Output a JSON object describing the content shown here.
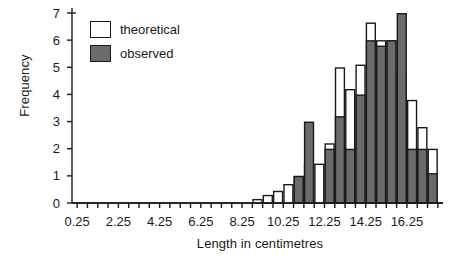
{
  "chart_data": {
    "type": "bar",
    "title": "",
    "subtitle": "",
    "xlabel": "Length in centimetres",
    "ylabel": "Frequency",
    "xlim": [
      0.0,
      18.0
    ],
    "ylim": [
      0,
      7
    ],
    "bin_width": 0.5,
    "grid": false,
    "legend_position": "top-left",
    "x_tick_labels": [
      "0.25",
      "2.25",
      "4.25",
      "6.25",
      "8.25",
      "10.25",
      "12.25",
      "14.25",
      "16.25"
    ],
    "x_tick_values": [
      0.25,
      2.25,
      4.25,
      6.25,
      8.25,
      10.25,
      12.25,
      14.25,
      16.25
    ],
    "x_minor_tick_step": 0.5,
    "y_tick_labels": [
      "0",
      "1",
      "2",
      "3",
      "4",
      "5",
      "6",
      "7"
    ],
    "y_tick_values": [
      0,
      1,
      2,
      3,
      4,
      5,
      6,
      7
    ],
    "bin_starts": [
      8.75,
      9.25,
      9.75,
      10.25,
      10.75,
      11.25,
      11.75,
      12.25,
      12.75,
      13.25,
      13.75,
      14.25,
      14.75,
      15.25,
      15.75,
      16.25,
      16.75,
      17.25
    ],
    "series": [
      {
        "name": "theoretical",
        "style": "outline",
        "color": "#ffffff",
        "edge_color": "#1a1a1a",
        "values": [
          0.15,
          0.3,
          0.45,
          0.7,
          1.0,
          1.45,
          1.45,
          2.2,
          5.0,
          4.2,
          5.1,
          6.65,
          6.0,
          6.0,
          4.8,
          3.8,
          2.8,
          2.0
        ]
      },
      {
        "name": "observed",
        "style": "filled",
        "color": "#6b6b6b",
        "edge_color": "#1a1a1a",
        "values": [
          0,
          0,
          0,
          0,
          1.0,
          3.0,
          0,
          2.0,
          3.2,
          2.0,
          4.0,
          6.0,
          5.8,
          6.0,
          7.0,
          2.0,
          2.0,
          1.1
        ]
      }
    ]
  },
  "legend": {
    "items": [
      {
        "label": "theoretical",
        "swatch": "white"
      },
      {
        "label": "observed",
        "swatch": "gray"
      }
    ]
  },
  "colors": {
    "observed_fill": "#6b6b6b",
    "theoretical_fill": "#ffffff",
    "axis": "#1a1a1a",
    "background": "#ffffff"
  }
}
